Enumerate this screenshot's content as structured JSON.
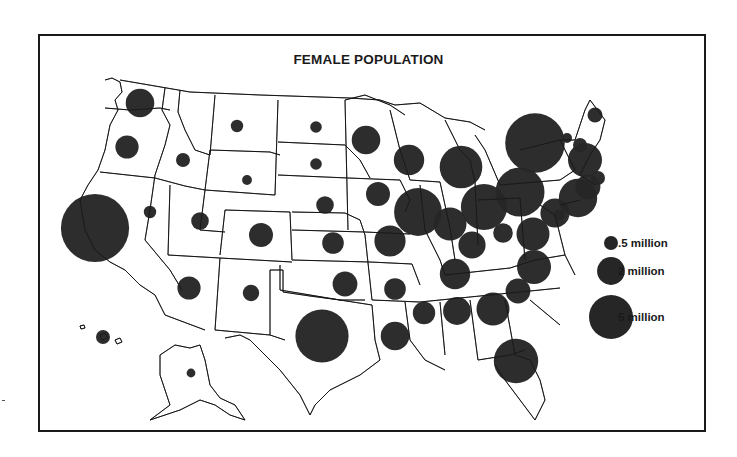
{
  "title": "FEMALE POPULATION",
  "colors": {
    "bubble": "#262626",
    "border": "#1a1a1a",
    "background": "#ffffff"
  },
  "legend": {
    "items": [
      {
        "label": ".5 million",
        "value": 0.5
      },
      {
        "label": "2 million",
        "value": 2
      },
      {
        "label": "5 million",
        "value": 5
      }
    ]
  },
  "chart_data": {
    "type": "proportional-symbol-map",
    "title": "FEMALE POPULATION",
    "unit": "million",
    "legend_placement": "right",
    "states": [
      {
        "state": "Washington",
        "value": 2.1
      },
      {
        "state": "Oregon",
        "value": 1.4
      },
      {
        "state": "California",
        "value": 12.0
      },
      {
        "state": "Idaho",
        "value": 0.5
      },
      {
        "state": "Nevada",
        "value": 0.4
      },
      {
        "state": "Montana",
        "value": 0.4
      },
      {
        "state": "Wyoming",
        "value": 0.25
      },
      {
        "state": "Utah",
        "value": 0.8
      },
      {
        "state": "Colorado",
        "value": 1.5
      },
      {
        "state": "Arizona",
        "value": 1.4
      },
      {
        "state": "New Mexico",
        "value": 0.7
      },
      {
        "state": "North Dakota",
        "value": 0.35
      },
      {
        "state": "South Dakota",
        "value": 0.35
      },
      {
        "state": "Nebraska",
        "value": 0.8
      },
      {
        "state": "Kansas",
        "value": 1.2
      },
      {
        "state": "Oklahoma",
        "value": 1.6
      },
      {
        "state": "Texas",
        "value": 7.3
      },
      {
        "state": "Minnesota",
        "value": 2.1
      },
      {
        "state": "Iowa",
        "value": 1.5
      },
      {
        "state": "Missouri",
        "value": 2.5
      },
      {
        "state": "Arkansas",
        "value": 1.2
      },
      {
        "state": "Louisiana",
        "value": 2.1
      },
      {
        "state": "Wisconsin",
        "value": 2.4
      },
      {
        "state": "Illinois",
        "value": 5.9
      },
      {
        "state": "Michigan",
        "value": 4.7
      },
      {
        "state": "Indiana",
        "value": 2.8
      },
      {
        "state": "Ohio",
        "value": 5.5
      },
      {
        "state": "Kentucky",
        "value": 1.9
      },
      {
        "state": "Tennessee",
        "value": 2.4
      },
      {
        "state": "Mississippi",
        "value": 1.3
      },
      {
        "state": "Alabama",
        "value": 2.0
      },
      {
        "state": "Georgia",
        "value": 2.8
      },
      {
        "state": "Florida",
        "value": 5.1
      },
      {
        "state": "South Carolina",
        "value": 1.6
      },
      {
        "state": "North Carolina",
        "value": 3.0
      },
      {
        "state": "Virginia",
        "value": 2.8
      },
      {
        "state": "West Virginia",
        "value": 1.0
      },
      {
        "state": "Pennsylvania",
        "value": 6.2
      },
      {
        "state": "New York",
        "value": 9.2
      },
      {
        "state": "Maryland",
        "value": 2.2
      },
      {
        "state": "Delaware",
        "value": 0.3
      },
      {
        "state": "New Jersey",
        "value": 3.8
      },
      {
        "state": "Connecticut",
        "value": 1.6
      },
      {
        "state": "Rhode Island",
        "value": 0.5
      },
      {
        "state": "Massachusetts",
        "value": 3.0
      },
      {
        "state": "Vermont",
        "value": 0.26
      },
      {
        "state": "New Hampshire",
        "value": 0.5
      },
      {
        "state": "Maine",
        "value": 0.58
      },
      {
        "state": "Alaska",
        "value": 0.2
      },
      {
        "state": "Hawaii",
        "value": 0.5
      }
    ]
  }
}
